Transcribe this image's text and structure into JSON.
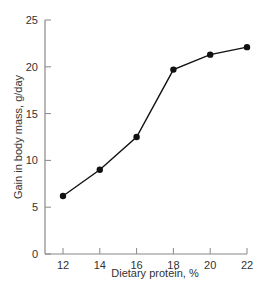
{
  "chart_data": {
    "type": "line",
    "title": "",
    "xlabel": "Dietary protein, %",
    "ylabel": "Gain in body mass, g/day",
    "x": [
      12,
      14,
      16,
      18,
      20,
      22
    ],
    "values": [
      6.2,
      9.0,
      12.5,
      19.7,
      21.3,
      22.1
    ],
    "xticks": [
      12,
      14,
      16,
      18,
      20,
      22
    ],
    "yticks": [
      0,
      5,
      10,
      15,
      20,
      25
    ],
    "xlim": [
      11,
      22
    ],
    "ylim": [
      0,
      25
    ],
    "grid": false,
    "markers": true
  }
}
